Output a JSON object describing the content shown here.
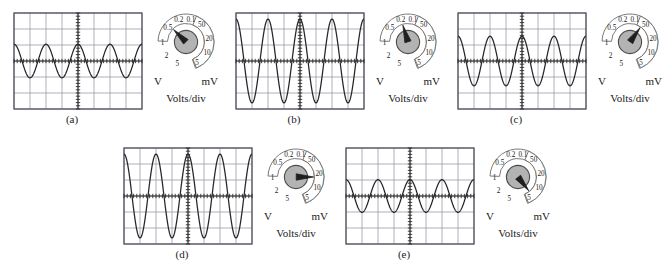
{
  "figure": {
    "type": "oscilloscope-panels",
    "grid": {
      "cols": 8,
      "rows": 6,
      "cell_px": 16
    },
    "knob": {
      "title": "Volts/div",
      "left_unit": "V",
      "right_unit": "mV",
      "left_labels": [
        "0.1",
        "0.2",
        "0.5",
        "1",
        "2",
        "5"
      ],
      "right_labels": [
        "50",
        "20",
        "10",
        "5"
      ],
      "dial_fill": "#b3b3b3",
      "dial_stroke": "#4d4d4d"
    },
    "trace_color": "#262626",
    "grid_color": "#9a9aa6"
  },
  "panels": [
    {
      "caption": "(a)",
      "x": 0,
      "y": 0,
      "setting_value": "0.5",
      "setting_unit": "V",
      "pointer_angle_deg": 225,
      "wave": {
        "amplitude_div": 1.05,
        "cycles": 4.0,
        "phase_deg": 90
      }
    },
    {
      "caption": "(b)",
      "x": 222,
      "y": 0,
      "setting_value": "0.2",
      "setting_unit": "V",
      "pointer_angle_deg": 253,
      "wave": {
        "amplitude_div": 2.62,
        "cycles": 4.0,
        "phase_deg": 90
      }
    },
    {
      "caption": "(c)",
      "x": 444,
      "y": 0,
      "setting_value": "50",
      "setting_unit": "mV",
      "pointer_angle_deg": 305,
      "wave": {
        "amplitude_div": 1.55,
        "cycles": 4.0,
        "phase_deg": 90
      }
    },
    {
      "caption": "(d)",
      "x": 110,
      "y": 135,
      "setting_value": "20",
      "setting_unit": "mV",
      "pointer_angle_deg": 0,
      "wave": {
        "amplitude_div": 2.62,
        "cycles": 4.0,
        "phase_deg": 90
      }
    },
    {
      "caption": "(e)",
      "x": 332,
      "y": 135,
      "setting_value": "5",
      "setting_unit": "mV",
      "pointer_angle_deg": 52,
      "wave": {
        "amplitude_div": 1.02,
        "cycles": 4.0,
        "phase_deg": 90
      }
    }
  ],
  "chart_data": {
    "type": "line",
    "title": "",
    "xlabel": "",
    "ylabel": "",
    "axis_units": "divisions",
    "xlim": [
      0,
      8
    ],
    "ylim": [
      -3,
      3
    ],
    "grid": true,
    "legend": "none",
    "series": [
      {
        "name": "(a)",
        "waveform": "sine",
        "amplitude_div": 1.05,
        "peak_to_peak_div": 2.1,
        "cycles_on_screen": 4.0,
        "volts_per_div": "0.5 V"
      },
      {
        "name": "(b)",
        "waveform": "sine",
        "amplitude_div": 2.62,
        "peak_to_peak_div": 5.25,
        "cycles_on_screen": 4.0,
        "volts_per_div": "0.2 V"
      },
      {
        "name": "(c)",
        "waveform": "sine",
        "amplitude_div": 1.55,
        "peak_to_peak_div": 3.1,
        "cycles_on_screen": 4.0,
        "volts_per_div": "50 mV"
      },
      {
        "name": "(d)",
        "waveform": "sine",
        "amplitude_div": 2.62,
        "peak_to_peak_div": 5.25,
        "cycles_on_screen": 4.0,
        "volts_per_div": "20 mV"
      },
      {
        "name": "(e)",
        "waveform": "sine",
        "amplitude_div": 1.02,
        "peak_to_peak_div": 2.05,
        "cycles_on_screen": 4.0,
        "volts_per_div": "5 mV"
      }
    ]
  }
}
